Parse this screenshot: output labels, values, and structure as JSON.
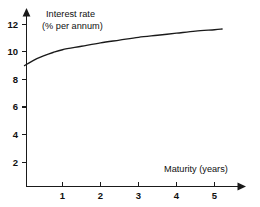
{
  "chart_data": {
    "type": "line",
    "title": "",
    "subtitle": "",
    "xlabel": "Maturity (years)",
    "ylabel_line1": "Interest rate",
    "ylabel_line2": "(% per annum)",
    "ylabel": "Interest rate (% per annum)",
    "xlim": [
      0,
      5.5
    ],
    "ylim": [
      0,
      13
    ],
    "xticks": [
      1,
      2,
      3,
      4,
      5
    ],
    "xtick_labels": [
      "1",
      "2",
      "3",
      "4",
      "5"
    ],
    "yticks": [
      2,
      4,
      6,
      8,
      10,
      12
    ],
    "ytick_labels": [
      "2",
      "4",
      "6",
      "8",
      "10",
      "12"
    ],
    "grid": false,
    "legend": false,
    "legend_position": "none",
    "x_axis_arrow": true,
    "y_axis_arrow": true,
    "series": [
      {
        "name": "Yield curve",
        "color": "#1a1a1a",
        "x": [
          0.0,
          0.25,
          0.5,
          0.75,
          1.0,
          1.5,
          2.0,
          2.5,
          3.0,
          3.5,
          4.0,
          4.5,
          5.0,
          5.2
        ],
        "values": [
          9.0,
          9.4,
          9.7,
          9.95,
          10.15,
          10.4,
          10.65,
          10.85,
          11.05,
          11.2,
          11.35,
          11.5,
          11.6,
          11.65
        ]
      }
    ],
    "annotations": []
  },
  "axes": {
    "y_axis_name": "vertical-axis",
    "x_axis_name": "horizontal-axis"
  }
}
